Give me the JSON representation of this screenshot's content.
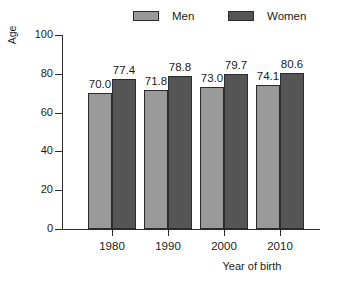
{
  "chart_data": {
    "type": "bar",
    "title": "",
    "xlabel": "Year of birth",
    "ylabel": "Age",
    "categories": [
      "1980",
      "1990",
      "2000",
      "2010"
    ],
    "series": [
      {
        "name": "Men",
        "values": [
          70.0,
          71.8,
          73.0,
          74.1
        ],
        "color": "#9a9a9a"
      },
      {
        "name": "Women",
        "values": [
          77.4,
          78.8,
          79.7,
          80.6
        ],
        "color": "#555555"
      }
    ],
    "value_labels": [
      "70.0",
      "77.4",
      "71.8",
      "78.8",
      "73.0",
      "79.7",
      "74.1",
      "80.6"
    ],
    "ylim": [
      0,
      100
    ],
    "yticks": [
      0,
      20,
      40,
      60,
      80,
      100
    ],
    "ytick_labels": [
      "0",
      "20",
      "40",
      "60",
      "80",
      "100"
    ],
    "grid": false,
    "legend_position": "top"
  },
  "legend": {
    "men_label": "Men",
    "women_label": "Women"
  },
  "axes": {
    "y_label": "Age",
    "x_label": "Year of birth"
  },
  "clipped_title": ""
}
